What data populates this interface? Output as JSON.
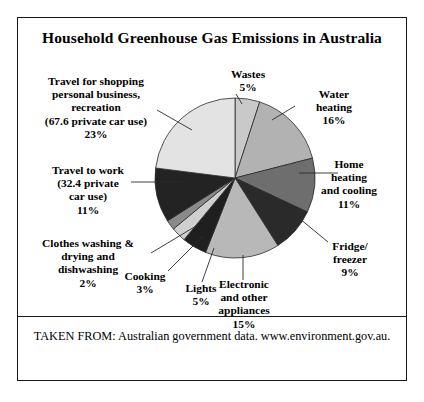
{
  "figure": {
    "title": "Household Greenhouse Gas Emissions in Australia",
    "footer": "TAKEN FROM: Australian government data. www.environment.gov.au."
  },
  "chart_data": {
    "type": "pie",
    "title": "Household Greenhouse Gas Emissions in Australia",
    "xlabel": "",
    "ylabel": "",
    "legend": "none",
    "grid": false,
    "units": "percent",
    "start_angle_deg": 0,
    "direction": "clockwise",
    "categories": [
      "Wastes",
      "Water heating",
      "Home heating and cooling",
      "Fridge/ freezer",
      "Electronic and other appliances",
      "Lights",
      "Cooking",
      "Clothes washing & drying and dishwashing",
      "Travel to work (32.4 private car use)",
      "Travel for shopping personal business, recreation (67.6 private car use)"
    ],
    "values": [
      5,
      16,
      11,
      9,
      15,
      5,
      3,
      2,
      11,
      23
    ],
    "colors": [
      "#c9c9c9",
      "#b2b2b2",
      "#6e6e6e",
      "#2a2a2a",
      "#b8b8b8",
      "#1f1f1f",
      "#cfcfcf",
      "#8a8a8a",
      "#232323",
      "#e3e3e3"
    ],
    "slices": [
      {
        "name": "Wastes",
        "label": "Wastes",
        "value_label": "5%",
        "value": 5,
        "color": "#c9c9c9"
      },
      {
        "name": "Water heating",
        "label": "Water\nheating",
        "value_label": "16%",
        "value": 16,
        "color": "#b2b2b2"
      },
      {
        "name": "Home heating and cooling",
        "label": "Home\nheating\nand cooling",
        "value_label": "11%",
        "value": 11,
        "color": "#6e6e6e"
      },
      {
        "name": "Fridge/ freezer",
        "label": "Fridge/\nfreezer",
        "value_label": "9%",
        "value": 9,
        "color": "#2a2a2a"
      },
      {
        "name": "Electronic and other appliances",
        "label": "Electronic\nand other\nappliances",
        "value_label": "15%",
        "value": 15,
        "color": "#b8b8b8"
      },
      {
        "name": "Lights",
        "label": "Lights",
        "value_label": "5%",
        "value": 5,
        "color": "#1f1f1f"
      },
      {
        "name": "Cooking",
        "label": "Cooking",
        "value_label": "3%",
        "value": 3,
        "color": "#cfcfcf"
      },
      {
        "name": "Clothes washing and drying and dishwashing",
        "label": "Clothes washing &\ndrying and\ndishwashing",
        "value_label": "2%",
        "value": 2,
        "color": "#8a8a8a"
      },
      {
        "name": "Travel to work",
        "label": "Travel to work\n(32.4 private\ncar use)",
        "value_label": "11%",
        "value": 11,
        "color": "#232323"
      },
      {
        "name": "Travel for shopping personal business recreation",
        "label": "Travel for shopping\npersonal business,\nrecreation\n(67.6 private car use)",
        "value_label": "23%",
        "value": 23,
        "color": "#e3e3e3"
      }
    ]
  },
  "labels": {
    "wastes": "Wastes\n5%",
    "water_heating": "Water\nheating\n16%",
    "home_heating": "Home\nheating\nand cooling\n11%",
    "fridge_freezer": "Fridge/\nfreezer\n9%",
    "electronic": "Electronic\nand other\nappliances\n15%",
    "lights": "Lights\n5%",
    "cooking": "Cooking\n3%",
    "clothes_washing": "Clothes washing &\ndrying and\ndishwashing\n2%",
    "travel_to_work": "Travel to work\n(32.4 private\ncar use)\n11%",
    "travel_shopping": "Travel for shopping\npersonal business,\nrecreation\n(67.6 private car use)\n23%"
  }
}
